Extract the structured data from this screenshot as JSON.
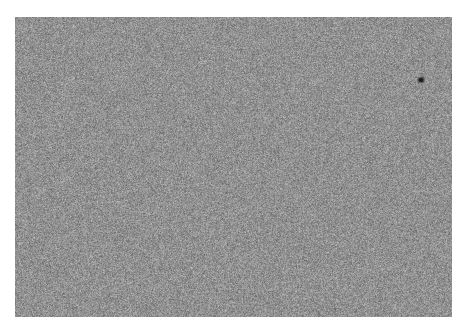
{
  "image": {
    "kind": "grayscale-noise-texture",
    "canvas_width": 461,
    "canvas_height": 331,
    "background_color": "#ffffff"
  },
  "texture_panel": {
    "name": "noise-texture-panel",
    "x": 15,
    "y": 17,
    "width": 437,
    "height": 300,
    "base_gray": "#919191",
    "dark_speckle_color": "#2a2a2a",
    "light_speckle_color": "#e8e8e8",
    "grain_size_px": 1,
    "contrast": "medium",
    "uniformity": "uniform"
  },
  "artifacts": [
    {
      "name": "dark-defect-spot",
      "x": 421,
      "y": 80,
      "width": 5,
      "height": 4,
      "color": "#1c1c1c",
      "shape": "ellipse"
    }
  ],
  "text_content": {
    "labels": [],
    "title": "",
    "caption": ""
  }
}
